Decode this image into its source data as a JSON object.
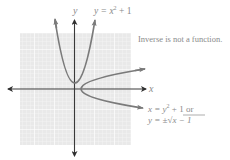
{
  "figure": {
    "axis_labels": {
      "x": "x",
      "y": "y"
    },
    "curves": [
      {
        "name": "parabola",
        "equation": "y = x² + 1",
        "eq_main": "y = x",
        "eq_sup": "2",
        "eq_tail": " + 1"
      },
      {
        "name": "inverse-relation",
        "line1_main": "x = y",
        "line1_sup": "2",
        "line1_tail": " + 1 or",
        "line2": "y = ±√(x − 1)",
        "line2_prefix": "y = ±",
        "line2_radicand": "x − 1"
      }
    ],
    "note": "Inverse is not a function.",
    "colors": {
      "grid_bg": "#ebebeb",
      "grid_line": "#ffffff",
      "axis": "#3a3a3a",
      "curve": "#7a7a7a",
      "text": "#8a8a8a"
    }
  }
}
